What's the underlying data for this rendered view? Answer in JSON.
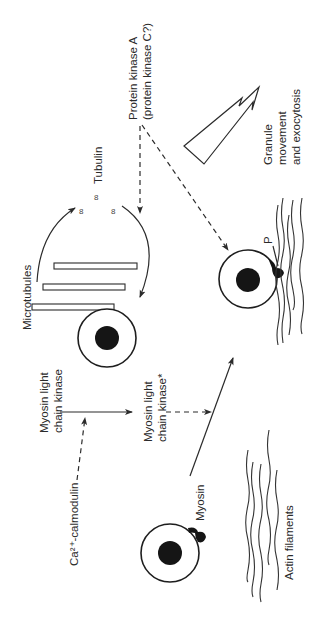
{
  "diagram": {
    "orientation": "rotated-90-ccw",
    "labels": {
      "protein_kinase_line1": "Protein kinase A",
      "protein_kinase_line2": "(protein kinase C?)",
      "tubulin": "Tubulin",
      "tubulin_dimer_glyph": "8",
      "microtubules": "Microtubules",
      "granule_line1": "Granule",
      "granule_line2": "movement",
      "granule_line3": "and exocytosis",
      "phosphate": "P",
      "mlck_line1": "Myosin light",
      "mlck_line2": "chain kinase",
      "mlck_active_line1": "Myosin light",
      "mlck_active_line2": "chain kinase*",
      "ca_calmodulin": "Ca²⁺-calmodulin",
      "myosin": "Myosin",
      "actin_filaments": "Actin filaments"
    },
    "nodes": [
      {
        "id": "cell-microtubule",
        "desc": "granule with nucleus attached to microtubules"
      },
      {
        "id": "cell-phosphorylated",
        "desc": "granule with phosphorylated myosin bound to actin"
      },
      {
        "id": "cell-myosin",
        "desc": "granule with myosin head"
      }
    ],
    "edges": [
      {
        "from": "Myosin light chain kinase",
        "to": "Myosin light chain kinase*",
        "style": "solid"
      },
      {
        "from": "Ca2+-calmodulin",
        "to": "Myosin light chain kinase activation",
        "style": "dashed"
      },
      {
        "from": "Myosin light chain kinase*",
        "to": "myosin-to-actin arrow",
        "style": "dashed"
      },
      {
        "from": "cell-myosin",
        "to": "cell-phosphorylated",
        "style": "solid"
      },
      {
        "from": "Protein kinase A",
        "to": "tubulin/microtubule cycle",
        "style": "dashed"
      },
      {
        "from": "Protein kinase A",
        "to": "cell-phosphorylated",
        "style": "dashed"
      },
      {
        "from": "Microtubules",
        "to": "Tubulin",
        "style": "solid-curved"
      },
      {
        "from": "Tubulin",
        "to": "Microtubules",
        "style": "solid-curved"
      },
      {
        "from": "process",
        "to": "Granule movement and exocytosis",
        "style": "open-block-arrow"
      }
    ]
  }
}
